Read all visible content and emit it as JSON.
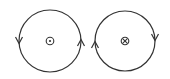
{
  "diagram": {
    "stroke_color": "#333333",
    "background_color": "#ffffff",
    "loops": [
      {
        "id": "left-loop",
        "center": [
          50,
          41
        ],
        "radius": 31,
        "center_symbol": "dot-in-circle",
        "center_symbol_meaning": "out of page",
        "arrows": [
          {
            "position": "left",
            "direction": "down"
          },
          {
            "position": "right",
            "direction": "up"
          }
        ],
        "circulation": "counterclockwise"
      },
      {
        "id": "right-loop",
        "center": [
          125,
          41
        ],
        "radius": 30,
        "center_symbol": "cross-in-circle",
        "center_symbol_meaning": "into page",
        "arrows": [
          {
            "position": "left",
            "direction": "up"
          },
          {
            "position": "right",
            "direction": "down"
          }
        ],
        "circulation": "clockwise"
      }
    ]
  }
}
